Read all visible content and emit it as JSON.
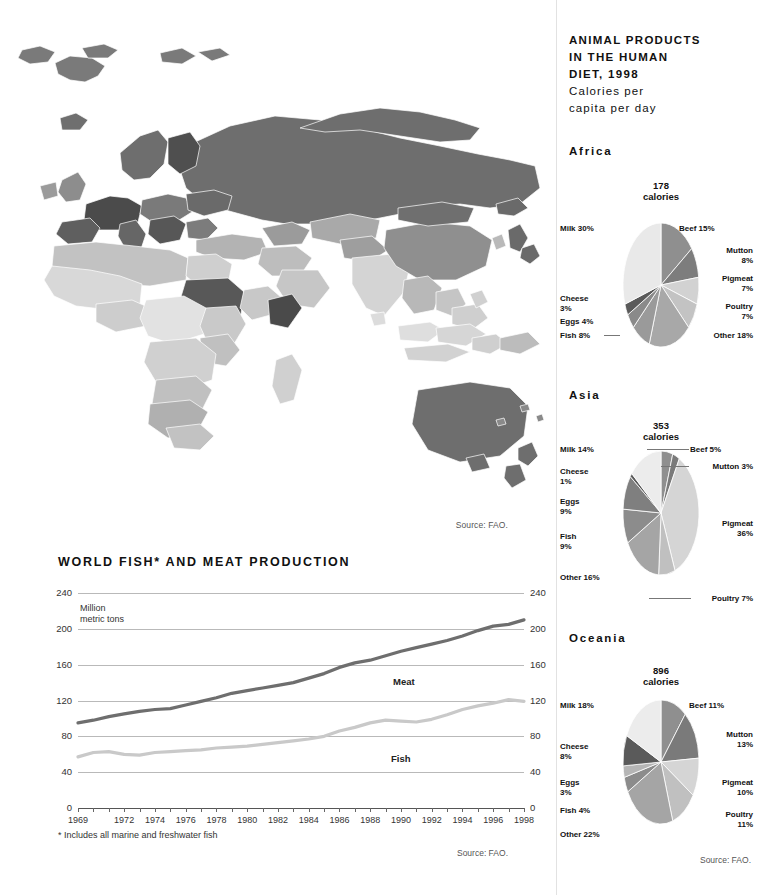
{
  "map": {
    "source": "Source: FAO.",
    "name": "world-choropleth-animal-products"
  },
  "line_chart": {
    "title": "WORLD FISH* AND MEAT PRODUCTION",
    "axis_unit": "Million\nmetric tons",
    "footnote": "* Includes all marine and freshwater fish",
    "source": "Source: FAO."
  },
  "pie_panel": {
    "title_line1": "ANIMAL PRODUCTS",
    "title_line2": "IN THE HUMAN",
    "title_line3": "DIET, 1998",
    "subtitle_line1": "Calories per",
    "subtitle_line2": "capita per day",
    "source": "Source: FAO."
  },
  "chart_data": [
    {
      "type": "line",
      "title": "WORLD FISH* AND MEAT PRODUCTION",
      "xlabel": "",
      "ylabel": "Million metric tons",
      "ylim": [
        0,
        240
      ],
      "yticks": [
        0,
        40,
        80,
        120,
        160,
        200,
        240
      ],
      "grid": true,
      "legend": "inline-labels",
      "x": [
        1969,
        1970,
        1971,
        1972,
        1973,
        1974,
        1975,
        1976,
        1977,
        1978,
        1979,
        1980,
        1981,
        1982,
        1983,
        1984,
        1985,
        1986,
        1987,
        1988,
        1989,
        1990,
        1991,
        1992,
        1993,
        1994,
        1995,
        1996,
        1997,
        1998
      ],
      "xtick_labels": [
        "1969",
        "1972",
        "1974",
        "1976",
        "1978",
        "1980",
        "1982",
        "1984",
        "1986",
        "1988",
        "1990",
        "1992",
        "1994",
        "1996",
        "1998"
      ],
      "series": [
        {
          "name": "Meat",
          "color": "#6e6e6e",
          "values": [
            95,
            98,
            102,
            105,
            108,
            110,
            111,
            115,
            119,
            123,
            128,
            131,
            134,
            137,
            140,
            145,
            150,
            157,
            162,
            165,
            170,
            175,
            179,
            183,
            187,
            192,
            198,
            203,
            205,
            210,
            218
          ]
        },
        {
          "name": "Fish",
          "color": "#c9c9c9",
          "values": [
            57,
            62,
            63,
            60,
            59,
            62,
            63,
            64,
            65,
            67,
            68,
            69,
            71,
            73,
            75,
            77,
            80,
            86,
            90,
            95,
            98,
            97,
            96,
            99,
            104,
            110,
            114,
            117,
            121,
            119,
            117
          ]
        }
      ]
    },
    {
      "type": "pie",
      "title": "Africa",
      "center_label": "178\ncalories",
      "calories": 178,
      "calories_unit": "calories",
      "labels": [
        "Beef",
        "Mutton",
        "Pigmeat",
        "Poultry",
        "Other",
        "Fish",
        "Eggs",
        "Cheese",
        "Milk"
      ],
      "values": [
        15,
        8,
        7,
        7,
        18,
        8,
        4,
        3,
        30
      ],
      "colors": [
        "#8f8f8f",
        "#7d7d7d",
        "#d2d2d2",
        "#c3c3c3",
        "#a8a8a8",
        "#9a9a9a",
        "#8a8a8a",
        "#5a5a5a",
        "#e9e9e9"
      ],
      "label_texts": [
        "Beef 15%",
        "Mutton\n8%",
        "Pigmeat\n7%",
        "Poultry\n7%",
        "Other 18%",
        "Fish 8%",
        "Eggs 4%",
        "Cheese\n3%",
        "Milk 30%"
      ]
    },
    {
      "type": "pie",
      "title": "Asia",
      "center_label": "353\ncalories",
      "calories": 353,
      "calories_unit": "calories",
      "labels": [
        "Beef",
        "Mutton",
        "Pigmeat",
        "Poultry",
        "Other",
        "Fish",
        "Eggs",
        "Cheese",
        "Milk"
      ],
      "values": [
        5,
        3,
        36,
        7,
        16,
        9,
        9,
        1,
        14
      ],
      "colors": [
        "#8f8f8f",
        "#7a7a7a",
        "#d5d5d5",
        "#c0c0c0",
        "#a5a5a5",
        "#8c8c8c",
        "#7f7f7f",
        "#5a5a5a",
        "#ececec"
      ],
      "label_texts": [
        "Beef 5%",
        "Mutton 3%",
        "Pigmeat\n36%",
        "Poultry 7%",
        "Other 16%",
        "Fish\n9%",
        "Eggs\n9%",
        "Cheese\n1%",
        "Milk 14%"
      ]
    },
    {
      "type": "pie",
      "title": "Oceania",
      "center_label": "896\ncalories",
      "calories": 896,
      "calories_unit": "calories",
      "labels": [
        "Beef",
        "Mutton",
        "Pigmeat",
        "Poultry",
        "Other",
        "Fish",
        "Eggs",
        "Cheese",
        "Milk"
      ],
      "values": [
        11,
        13,
        10,
        11,
        22,
        4,
        3,
        8,
        18
      ],
      "colors": [
        "#8f8f8f",
        "#7a7a7a",
        "#d5d5d5",
        "#c0c0c0",
        "#a5a5a5",
        "#8c8c8c",
        "#b5b5b5",
        "#5a5a5a",
        "#ececec"
      ],
      "label_texts": [
        "Beef 11%",
        "Mutton\n13%",
        "Pigmeat\n10%",
        "Poultry\n11%",
        "Other 22%",
        "Fish 4%",
        "Eggs\n3%",
        "Cheese\n8%",
        "Milk 18%"
      ]
    }
  ],
  "regions": [
    {
      "name": "Africa",
      "calories": "178",
      "unit": "calories"
    },
    {
      "name": "Asia",
      "calories": "353",
      "unit": "calories"
    },
    {
      "name": "Oceania",
      "calories": "896",
      "unit": "calories"
    }
  ]
}
